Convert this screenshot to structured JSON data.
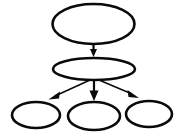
{
  "diagram": {
    "title": "",
    "type": "tree-graph",
    "background_color": "#ffffff",
    "node_fill_color": "#ffffff",
    "node_stroke_color": "#0a0a0a",
    "edge_color": "#0a0a0a",
    "node_count": 5,
    "edge_count": 4,
    "nodes": [
      {
        "id": "root",
        "label": "",
        "shape": "ellipse",
        "cx": 93.5,
        "cy": 24,
        "rx": 41,
        "ry": 20,
        "stroke_width": 2.6,
        "level": 0
      },
      {
        "id": "mid",
        "label": "",
        "shape": "ellipse",
        "cx": 94,
        "cy": 69,
        "rx": 41,
        "ry": 11,
        "stroke_width": 2.6,
        "level": 1
      },
      {
        "id": "leaf-left",
        "label": "",
        "shape": "ellipse",
        "cx": 36,
        "cy": 115,
        "rx": 24,
        "ry": 13,
        "stroke_width": 2.6,
        "level": 2
      },
      {
        "id": "leaf-center",
        "label": "",
        "shape": "ellipse",
        "cx": 94,
        "cy": 116,
        "rx": 26,
        "ry": 14,
        "stroke_width": 2.6,
        "level": 2
      },
      {
        "id": "leaf-right",
        "label": "",
        "shape": "ellipse",
        "cx": 149,
        "cy": 114,
        "rx": 23,
        "ry": 13,
        "stroke_width": 2.6,
        "level": 2
      }
    ],
    "edges": [
      {
        "id": "edge-root-mid",
        "from": "root",
        "to": "mid",
        "label": "",
        "x1": 93.5,
        "y1": 44,
        "x2": 93.5,
        "y2": 52,
        "stroke_width": 2.2,
        "arrowhead": "filled-triangle",
        "head_width": 7,
        "head_length": 7
      },
      {
        "id": "edge-mid-leaf-left",
        "from": "mid",
        "to": "leaf-left",
        "label": "",
        "x1": 90,
        "y1": 80,
        "x2": 52,
        "y2": 97,
        "stroke_width": 1.4,
        "arrowhead": "filled-triangle",
        "head_width": 6,
        "head_length": 9
      },
      {
        "id": "edge-mid-leaf-center",
        "from": "mid",
        "to": "leaf-center",
        "label": "",
        "x1": 94,
        "y1": 80,
        "x2": 94,
        "y2": 99,
        "stroke_width": 2.2,
        "arrowhead": "filled-triangle",
        "head_width": 8,
        "head_length": 9
      },
      {
        "id": "edge-mid-leaf-right",
        "from": "mid",
        "to": "leaf-right",
        "label": "",
        "x1": 99,
        "y1": 80,
        "x2": 136,
        "y2": 96,
        "stroke_width": 1.4,
        "arrowhead": "filled-triangle",
        "head_width": 6,
        "head_length": 9
      }
    ]
  }
}
